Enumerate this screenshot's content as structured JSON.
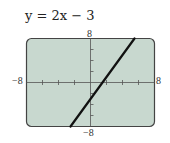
{
  "chart_data": {
    "type": "line",
    "title": "y = 2x − 3",
    "equation": {
      "slope": 2,
      "intercept": -3
    },
    "xlim": [
      -8,
      8
    ],
    "ylim": [
      -8,
      8
    ],
    "x_tick_step": 2,
    "y_tick_step": 2,
    "grid": false,
    "xlabel": "",
    "ylabel": "",
    "tick_labels": {
      "xmin": "−8",
      "xmax": "8",
      "ymin": "−8",
      "ymax": "8"
    },
    "series": [
      {
        "name": "y = 2x − 3",
        "x": [
          -2.5,
          5.5
        ],
        "y": [
          -8,
          8
        ]
      }
    ],
    "colors": {
      "background": "#c8d8cf",
      "frame": "#444444",
      "line": "#111111"
    }
  }
}
